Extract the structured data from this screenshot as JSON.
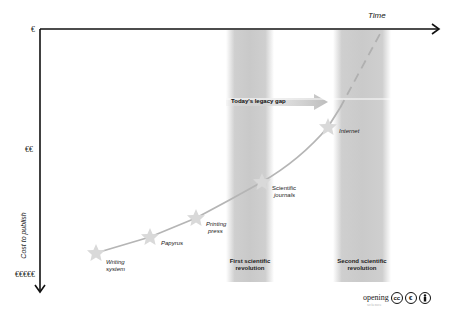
{
  "diagram": {
    "x_axis_label": "Time",
    "y_axis_label": "Cost to publish",
    "y_ticks": [
      {
        "label": "€",
        "y": 30
      },
      {
        "label": "€€",
        "y": 150
      },
      {
        "label": "€€€€€",
        "y": 276
      }
    ],
    "milestones": [
      {
        "label_line1": "Writing",
        "label_line2": "system"
      },
      {
        "label_line1": "Papyrus",
        "label_line2": ""
      },
      {
        "label_line1": "Printing",
        "label_line2": "press"
      },
      {
        "label_line1": "Scientific",
        "label_line2": "journals"
      },
      {
        "label_line1": "Internet",
        "label_line2": ""
      }
    ],
    "bands": [
      {
        "label_line1": "First scientific",
        "label_line2": "revolution"
      },
      {
        "label_line1": "Second scientific",
        "label_line2": "revolution"
      }
    ],
    "gap_label": "Today's legacy gap",
    "logo": {
      "word": "opening",
      "sub": "science",
      "cc": "cc",
      "by": "BY",
      "nc": "€"
    }
  },
  "colors": {
    "axis": "#111111",
    "band": "#cccccc",
    "curve": "#b8b8b8",
    "star": "#d8d8d8"
  }
}
